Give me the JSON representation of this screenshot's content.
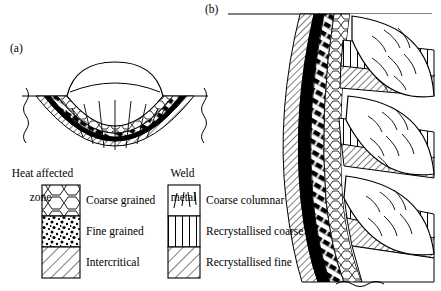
{
  "figure": {
    "panels": [
      {
        "tag": "(a)",
        "description": "single-pass weld bead cross-section with heat affected zone bands"
      },
      {
        "tag": "(b)",
        "description": "multi-pass weld showing stacked beads and recrystallised bands"
      }
    ]
  },
  "legends": [
    {
      "name": "heat-affected-zone",
      "title_line1": "Heat affected",
      "title_line2": "zone",
      "entries": [
        {
          "label": "Coarse grained",
          "pattern": "polygonal-grains"
        },
        {
          "label": "Fine grained",
          "pattern": "stipple"
        },
        {
          "label": "Intercritical",
          "pattern": "diagonal-hatch"
        }
      ]
    },
    {
      "name": "weld-metal",
      "title_line1": "Weld",
      "title_line2": "metal",
      "entries": [
        {
          "label": "Coarse columnar",
          "pattern": "sparse-strokes"
        },
        {
          "label": "Recrystallised coarse",
          "pattern": "vertical-hatch"
        },
        {
          "label": "Recrystallised fine",
          "pattern": "diagonal-hatch"
        }
      ]
    }
  ],
  "colors": {
    "ink": "#000000",
    "paper": "#ffffff"
  }
}
